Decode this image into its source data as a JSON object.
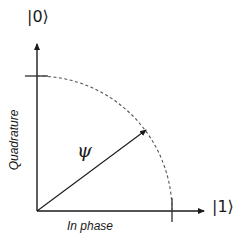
{
  "diagram": {
    "type": "phasor",
    "labels": {
      "state_zero": "|0⟩",
      "state_one": "|1⟩",
      "vector": "ψ",
      "y_axis": "Quadrature",
      "x_axis": "In phase"
    },
    "colors": {
      "line": "#1a1a1a",
      "dashed_arc": "#555555",
      "background": "#ffffff"
    }
  }
}
